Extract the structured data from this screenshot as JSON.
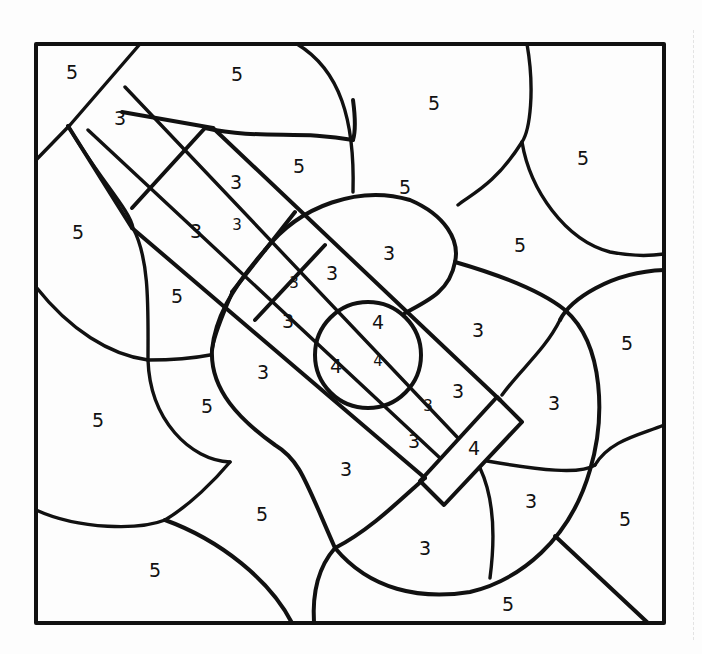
{
  "page": {
    "title": "",
    "background": "#ffffff",
    "line_color": "#111111"
  },
  "labels": [
    {
      "text": "5",
      "x": 72,
      "y": 72
    },
    {
      "text": "5",
      "x": 237,
      "y": 74
    },
    {
      "text": "5",
      "x": 434,
      "y": 103
    },
    {
      "text": "5",
      "x": 583,
      "y": 158
    },
    {
      "text": "3",
      "x": 120,
      "y": 118
    },
    {
      "text": "5",
      "x": 299,
      "y": 166
    },
    {
      "text": "5",
      "x": 405,
      "y": 187
    },
    {
      "text": "3",
      "x": 236,
      "y": 182
    },
    {
      "text": "3",
      "x": 237,
      "y": 225,
      "small": true
    },
    {
      "text": "5",
      "x": 78,
      "y": 232
    },
    {
      "text": "3",
      "x": 196,
      "y": 231
    },
    {
      "text": "3",
      "x": 389,
      "y": 253
    },
    {
      "text": "5",
      "x": 520,
      "y": 245
    },
    {
      "text": "3",
      "x": 332,
      "y": 273
    },
    {
      "text": "3",
      "x": 294,
      "y": 283,
      "small": true
    },
    {
      "text": "5",
      "x": 177,
      "y": 296
    },
    {
      "text": "3",
      "x": 288,
      "y": 321
    },
    {
      "text": "4",
      "x": 378,
      "y": 322
    },
    {
      "text": "3",
      "x": 478,
      "y": 330
    },
    {
      "text": "5",
      "x": 627,
      "y": 343
    },
    {
      "text": "4",
      "x": 336,
      "y": 366
    },
    {
      "text": "4",
      "x": 378,
      "y": 361,
      "small": true
    },
    {
      "text": "3",
      "x": 263,
      "y": 372
    },
    {
      "text": "3",
      "x": 458,
      "y": 391
    },
    {
      "text": "3",
      "x": 428,
      "y": 406,
      "small": true
    },
    {
      "text": "5",
      "x": 207,
      "y": 406
    },
    {
      "text": "3",
      "x": 554,
      "y": 403
    },
    {
      "text": "5",
      "x": 98,
      "y": 420
    },
    {
      "text": "3",
      "x": 414,
      "y": 441
    },
    {
      "text": "4",
      "x": 474,
      "y": 448
    },
    {
      "text": "3",
      "x": 346,
      "y": 469
    },
    {
      "text": "5",
      "x": 262,
      "y": 514
    },
    {
      "text": "3",
      "x": 531,
      "y": 501
    },
    {
      "text": "5",
      "x": 625,
      "y": 519
    },
    {
      "text": "3",
      "x": 425,
      "y": 548
    },
    {
      "text": "5",
      "x": 155,
      "y": 570
    },
    {
      "text": "5",
      "x": 508,
      "y": 604
    }
  ],
  "legend_numbers": [
    "3",
    "4",
    "5"
  ]
}
